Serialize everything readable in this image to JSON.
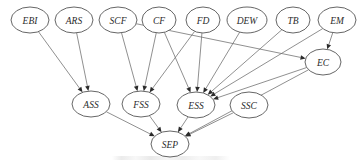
{
  "figure": {
    "type": "directed-acyclic-graph",
    "title": "",
    "background_color": "#ffffff",
    "node_fill_color": "#ffffff",
    "node_stroke_color": "#555555",
    "edge_color": "#6b6b6b",
    "label_color": "#2b2b2b",
    "node_shape": "ellipse",
    "label_style": "italic",
    "width": 358,
    "height": 162
  },
  "nodes": [
    {
      "id": "EBI",
      "label": "EBI",
      "cx": 30,
      "cy": 20,
      "rx": 19,
      "ry": 13,
      "layer": "top"
    },
    {
      "id": "ARS",
      "label": "ARS",
      "cx": 74,
      "cy": 20,
      "rx": 19,
      "ry": 13,
      "layer": "top"
    },
    {
      "id": "SCF",
      "label": "SCF",
      "cx": 118,
      "cy": 20,
      "rx": 19,
      "ry": 13,
      "layer": "top"
    },
    {
      "id": "CF",
      "label": "CF",
      "cx": 159,
      "cy": 20,
      "rx": 17,
      "ry": 13,
      "layer": "top"
    },
    {
      "id": "FD",
      "label": "FD",
      "cx": 203,
      "cy": 20,
      "rx": 17,
      "ry": 13,
      "layer": "top"
    },
    {
      "id": "DEW",
      "label": "DEW",
      "cx": 247,
      "cy": 20,
      "rx": 20,
      "ry": 13,
      "layer": "top"
    },
    {
      "id": "TB",
      "label": "TB",
      "cx": 293,
      "cy": 20,
      "rx": 17,
      "ry": 13,
      "layer": "top"
    },
    {
      "id": "EM",
      "label": "EM",
      "cx": 337,
      "cy": 20,
      "rx": 19,
      "ry": 13,
      "layer": "top"
    },
    {
      "id": "EC",
      "label": "EC",
      "cx": 323,
      "cy": 62,
      "rx": 18,
      "ry": 13,
      "layer": "middle-right"
    },
    {
      "id": "ASS",
      "label": "ASS",
      "cx": 91,
      "cy": 104,
      "rx": 19,
      "ry": 13,
      "layer": "middle"
    },
    {
      "id": "FSS",
      "label": "FSS",
      "cx": 141,
      "cy": 104,
      "rx": 19,
      "ry": 13,
      "layer": "middle"
    },
    {
      "id": "ESS",
      "label": "ESS",
      "cx": 196,
      "cy": 105,
      "rx": 19,
      "ry": 13,
      "layer": "middle"
    },
    {
      "id": "SSC",
      "label": "SSC",
      "cx": 249,
      "cy": 105,
      "rx": 19,
      "ry": 13,
      "layer": "middle"
    },
    {
      "id": "SEP",
      "label": "SEP",
      "cx": 170,
      "cy": 144,
      "rx": 19,
      "ry": 13,
      "layer": "bottom"
    }
  ],
  "edges": [
    {
      "from": "EBI",
      "to": "ASS"
    },
    {
      "from": "ARS",
      "to": "ASS"
    },
    {
      "from": "SCF",
      "to": "FSS"
    },
    {
      "from": "SCF",
      "to": "EC"
    },
    {
      "from": "CF",
      "to": "FSS"
    },
    {
      "from": "CF",
      "to": "ESS"
    },
    {
      "from": "FD",
      "to": "FSS"
    },
    {
      "from": "FD",
      "to": "ESS"
    },
    {
      "from": "DEW",
      "to": "ESS"
    },
    {
      "from": "TB",
      "to": "ESS"
    },
    {
      "from": "EM",
      "to": "EC"
    },
    {
      "from": "EM",
      "to": "ESS"
    },
    {
      "from": "EC",
      "to": "ESS"
    },
    {
      "from": "EC",
      "to": "SEP"
    },
    {
      "from": "ASS",
      "to": "SEP"
    },
    {
      "from": "FSS",
      "to": "SEP"
    },
    {
      "from": "ESS",
      "to": "SEP"
    },
    {
      "from": "SSC",
      "to": "SEP"
    }
  ],
  "caption": {
    "text": ""
  }
}
